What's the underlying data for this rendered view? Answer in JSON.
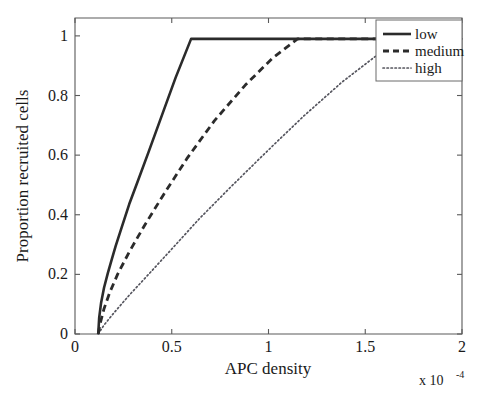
{
  "chart_data": {
    "type": "line",
    "title": "",
    "xlabel": "APC density",
    "ylabel": "Proportion recruited cells",
    "x_multiplier": "x 10",
    "x_multiplier_exponent": "-4",
    "xlim": [
      0,
      2
    ],
    "ylim": [
      0,
      1.06
    ],
    "grid": false,
    "legend_position": "top-right",
    "xticks": [
      0,
      0.5,
      1,
      1.5,
      2
    ],
    "xtick_labels": [
      "0",
      "0.5",
      "1",
      "1.5",
      "2"
    ],
    "yticks": [
      0,
      0.2,
      0.4,
      0.6,
      0.8,
      1
    ],
    "ytick_labels": [
      "0",
      "0.2",
      "0.4",
      "0.6",
      "0.8",
      "1"
    ],
    "threshold_x": 0.12,
    "series": [
      {
        "name": "low",
        "style": "solid",
        "saturation_x": 0.6,
        "x": [
          0.12,
          0.125,
          0.135,
          0.15,
          0.17,
          0.19,
          0.21,
          0.24,
          0.28,
          0.32,
          0.38,
          0.45,
          0.52,
          0.6,
          0.8,
          1.2,
          1.6,
          2.0
        ],
        "y": [
          0.0,
          0.055,
          0.105,
          0.155,
          0.205,
          0.25,
          0.295,
          0.355,
          0.435,
          0.505,
          0.61,
          0.735,
          0.86,
          0.99,
          0.99,
          0.99,
          0.99,
          0.99
        ]
      },
      {
        "name": "medium",
        "style": "dashed",
        "saturation_x": 1.15,
        "x": [
          0.12,
          0.13,
          0.15,
          0.18,
          0.22,
          0.28,
          0.36,
          0.46,
          0.58,
          0.72,
          0.88,
          1.02,
          1.15,
          1.4,
          1.7,
          2.0
        ],
        "y": [
          0.0,
          0.035,
          0.085,
          0.14,
          0.2,
          0.275,
          0.365,
          0.47,
          0.59,
          0.715,
          0.835,
          0.925,
          0.99,
          0.99,
          0.99,
          0.99
        ]
      },
      {
        "name": "high",
        "style": "dotted",
        "saturation_x": 1.7,
        "x": [
          0.12,
          0.15,
          0.2,
          0.28,
          0.38,
          0.5,
          0.64,
          0.8,
          0.98,
          1.18,
          1.38,
          1.55,
          1.7,
          1.85,
          2.0
        ],
        "y": [
          0.0,
          0.03,
          0.07,
          0.13,
          0.2,
          0.285,
          0.385,
          0.49,
          0.605,
          0.73,
          0.845,
          0.93,
          0.99,
          0.99,
          0.99
        ]
      }
    ]
  },
  "legend": {
    "items": [
      {
        "label": "low"
      },
      {
        "label": "medium"
      },
      {
        "label": "high"
      }
    ]
  },
  "colors": {
    "series_low": "#2b2b2b",
    "series_medium": "#2b2b2b",
    "series_high": "#55555e",
    "axis": "#5a5a5a",
    "background": "#ffffff"
  }
}
